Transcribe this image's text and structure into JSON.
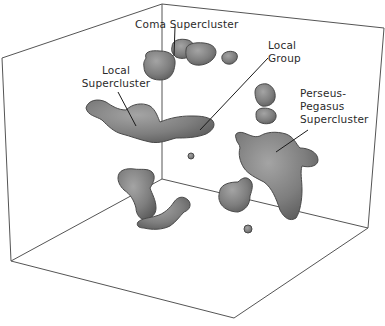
{
  "diagram": {
    "type": "3d-volume-isosurface",
    "colors": {
      "background": "#ffffff",
      "box_edge": "#555555",
      "blob_fill_light": "#9a9a9a",
      "blob_fill_dark": "#5e5e5e",
      "blob_edge": "#4a4a4a",
      "leader_line": "#1a1a1a",
      "label_text": "#2a2a2a"
    },
    "labels": [
      {
        "id": "coma",
        "lines": [
          "Coma Supercluster"
        ]
      },
      {
        "id": "local-supercluster",
        "lines": [
          "Local",
          "Supercluster"
        ]
      },
      {
        "id": "local-group",
        "lines": [
          "Local",
          "Group"
        ]
      },
      {
        "id": "perseus-pegasus",
        "lines": [
          "Perseus-",
          "Pegasus",
          "Supercluster"
        ]
      }
    ]
  }
}
